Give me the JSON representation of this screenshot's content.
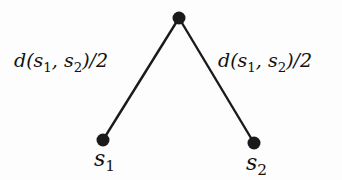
{
  "diagram": {
    "type": "tree",
    "nodes": [
      {
        "id": "root",
        "x": 179,
        "y": 18,
        "label": ""
      },
      {
        "id": "s1",
        "x": 103,
        "y": 140,
        "label_var": "s",
        "label_sub": "1"
      },
      {
        "id": "s2",
        "x": 254,
        "y": 143,
        "label_var": "s",
        "label_sub": "2"
      }
    ],
    "edges": [
      {
        "from": "root",
        "to": "s1",
        "label": {
          "fn": "d(",
          "a": "s",
          "a_sub": "1",
          "sep": ", ",
          "b": "s",
          "b_sub": "2",
          "tail": ")/2"
        }
      },
      {
        "from": "root",
        "to": "s2",
        "label": {
          "fn": "d(",
          "a": "s",
          "a_sub": "1",
          "sep": ", ",
          "b": "s",
          "b_sub": "2",
          "tail": ")/2"
        }
      }
    ],
    "colors": {
      "edge": "#1a1a1a",
      "node": "#1a1a1a",
      "background": "#fdfdfd"
    }
  }
}
